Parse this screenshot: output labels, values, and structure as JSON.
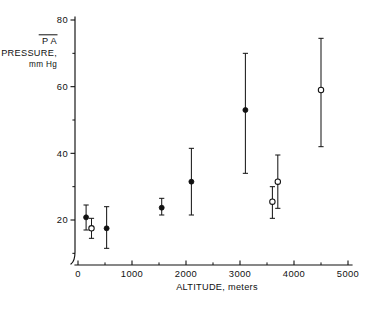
{
  "figure": {
    "background_color": "#ffffff",
    "ink_color": "#111111"
  },
  "chart_data": {
    "type": "scatter",
    "title": "",
    "subtitle": "",
    "xlabel": "ALTITUDE, meters",
    "ylabel_lines": [
      "P A",
      "PRESSURE,",
      "mm Hg"
    ],
    "ylabel": "PA PRESSURE, mm Hg",
    "ylabel_has_overbar": true,
    "xlim": [
      0,
      5000
    ],
    "ylim": [
      10,
      80
    ],
    "grid": false,
    "legend": "none",
    "xticks": [
      0,
      1000,
      2000,
      3000,
      4000,
      5000
    ],
    "xtick_labels": [
      "0",
      "1000",
      "2000",
      "3000",
      "4000",
      "5000"
    ],
    "xticks_minor": [
      500,
      1500,
      2500,
      3500,
      4500
    ],
    "yticks": [
      20,
      40,
      60,
      80
    ],
    "ytick_labels": [
      "20",
      "40",
      "60",
      "80"
    ],
    "yticks_minor": [
      10,
      30,
      50,
      70
    ],
    "error_bar_type": "range",
    "series": [
      {
        "name": "filled",
        "marker": "filled-circle",
        "points": [
          {
            "x": 150,
            "y": 20.8,
            "ylow": 17.0,
            "yhigh": 24.5
          },
          {
            "x": 530,
            "y": 17.5,
            "ylow": 11.5,
            "yhigh": 24.0
          },
          {
            "x": 1550,
            "y": 23.7,
            "ylow": 21.5,
            "yhigh": 26.5
          },
          {
            "x": 2100,
            "y": 31.5,
            "ylow": 21.5,
            "yhigh": 41.5
          },
          {
            "x": 3100,
            "y": 53.0,
            "ylow": 34.0,
            "yhigh": 70.0
          }
        ]
      },
      {
        "name": "open",
        "marker": "open-circle",
        "points": [
          {
            "x": 250,
            "y": 17.5,
            "ylow": 14.5,
            "yhigh": 20.5
          },
          {
            "x": 3600,
            "y": 25.5,
            "ylow": 20.5,
            "yhigh": 30.0
          },
          {
            "x": 3700,
            "y": 31.5,
            "ylow": 23.5,
            "yhigh": 39.5
          },
          {
            "x": 4500,
            "y": 59.0,
            "ylow": 42.0,
            "yhigh": 74.5
          }
        ]
      }
    ]
  }
}
